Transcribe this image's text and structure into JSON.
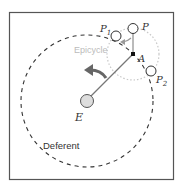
{
  "diagram": {
    "labels": {
      "earth": "E",
      "epicycle_center": "A",
      "planet": "P",
      "planet_1": "P",
      "planet_1_sub": "1",
      "planet_2": "P",
      "planet_2_sub": "2",
      "epicycle": "Epicycle",
      "deferent": "Deferent"
    },
    "colors": {
      "frame": "#555555",
      "deferent": "#333333",
      "epicycle": "#c8c8c8",
      "radius_line": "#777777",
      "earth_fill": "#dddddd",
      "arrow": "#666666",
      "small_arrow": "#999999",
      "epicycle_label": "#bbbbbb"
    }
  }
}
